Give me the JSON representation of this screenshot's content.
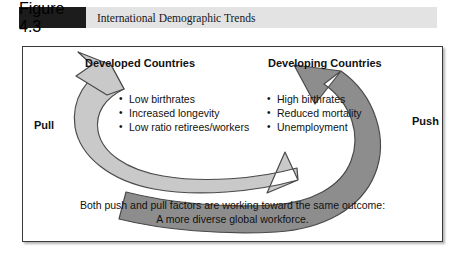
{
  "figure": {
    "number_label": "Figure 4.3",
    "title": "International Demographic Trends"
  },
  "diagram": {
    "columns": [
      {
        "heading": "Developed Countries",
        "flow_label": "Pull",
        "bullets": [
          "Low birthrates",
          "Increased longevity",
          "Low ratio retirees/workers"
        ]
      },
      {
        "heading": "Developing Countries",
        "flow_label": "Push",
        "bullets": [
          "High birthrates",
          "Reduced mortality",
          "Unemployment"
        ]
      }
    ],
    "caption": {
      "line1": "Both push and pull factors are working toward the same outcome:",
      "line2": "A more diverse global workforce."
    },
    "arrows": [
      {
        "name": "pull-arrow",
        "fill": "#c9c9c9",
        "stroke": "#4a4a4a"
      },
      {
        "name": "push-arrow",
        "fill": "#8d8d8d",
        "stroke": "#4a4a4a"
      }
    ]
  },
  "colors": {
    "header_band": "#e3e3e3",
    "figure_block": "#1c1c1c",
    "frame_border": "#3a3a3a",
    "text": "#111111",
    "arrow_light": "#c9c9c9",
    "arrow_dark": "#8d8d8d"
  }
}
